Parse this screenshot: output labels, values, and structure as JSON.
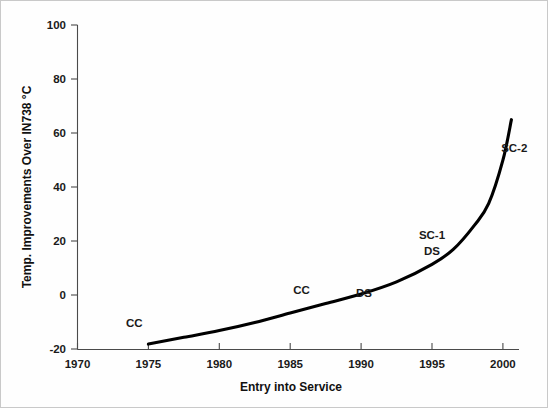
{
  "chart_data": {
    "type": "line",
    "title": "",
    "xlabel": "Entry into Service",
    "ylabel": "Temp. Improvements Over IN738 °C",
    "xlim": [
      1970,
      2001
    ],
    "ylim": [
      -20,
      100
    ],
    "grid": false,
    "legend": "none",
    "xticks": [
      "1970",
      "1975",
      "1980",
      "1985",
      "1990",
      "1995",
      "2000"
    ],
    "xtick_values": [
      1970,
      1975,
      1980,
      1985,
      1990,
      1995,
      2000
    ],
    "yticks": [
      "100",
      "80",
      "60",
      "40",
      "20",
      "0",
      "-20"
    ],
    "ytick_values": [
      100,
      80,
      60,
      40,
      20,
      0,
      -20
    ],
    "series": [
      {
        "name": "Temperature capability improvement",
        "x": [
          1975.0,
          1977.5,
          1980.0,
          1982.5,
          1985.0,
          1987.5,
          1990.0,
          1992.5,
          1995.0,
          1996.5,
          1998.0,
          1999.0,
          2000.0,
          2000.6
        ],
        "values": [
          -18.0,
          -15.5,
          -13.0,
          -10.0,
          -6.5,
          -3.0,
          0.5,
          5.0,
          11.5,
          17.0,
          26.0,
          34.0,
          50.0,
          65.0
        ]
      }
    ],
    "annotations": [
      {
        "text": "CC",
        "x": 1974.0,
        "y": -11.5
      },
      {
        "text": "CC",
        "x": 1985.8,
        "y": 0.5
      },
      {
        "text": "DS",
        "x": 1990.2,
        "y": -0.5
      },
      {
        "text": "SC-1",
        "x": 1995.0,
        "y": 21.0
      },
      {
        "text": "DS",
        "x": 1995.0,
        "y": 15.0
      },
      {
        "text": "SC-2",
        "x": 2000.8,
        "y": 53.0
      }
    ]
  },
  "axes": {
    "x_axis_title": "Entry into Service",
    "y_axis_title": "Temp. Improvements Over IN738 °C"
  },
  "style": {
    "curve_color": "#000000",
    "axis_color": "#4a4a4a",
    "text_color": "#1a1a1a",
    "background": "#ffffff"
  }
}
